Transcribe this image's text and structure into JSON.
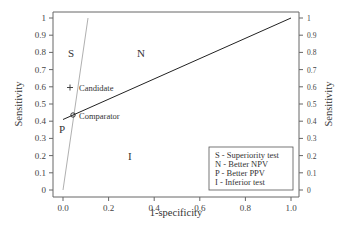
{
  "chart_data": {
    "type": "line",
    "title": "",
    "xlabel": "1-specificity",
    "ylabel": "Sensitivity",
    "ylabel_right": "Sensitivity",
    "xlim": [
      0.0,
      1.0
    ],
    "ylim": [
      0,
      1
    ],
    "x_ticks": [
      "0.0",
      "0.2",
      "0.4",
      "0.6",
      "0.8",
      "1.0"
    ],
    "y_ticks": [
      "0",
      "0.1",
      "0.2",
      "0.3",
      "0.4",
      "0.5",
      "0.6",
      "0.7",
      "0.8",
      "0.9",
      "1"
    ],
    "y_ticks_right": [
      "0",
      "0.1",
      "0.2",
      "0.3",
      "0.4",
      "0.5",
      "0.6",
      "0.7",
      "0.8",
      "0.9",
      "1"
    ],
    "grid": false,
    "series": [
      {
        "name": "Black line (through comparator to (1,1))",
        "color": "#222222",
        "x": [
          0.0,
          1.0
        ],
        "y": [
          0.41,
          1.0
        ]
      },
      {
        "name": "Grey line (through origin and comparator)",
        "color": "#aaaaaa",
        "x": [
          0.0,
          0.11
        ],
        "y": [
          0.0,
          1.0
        ]
      }
    ],
    "points": [
      {
        "label": "Candidate",
        "marker": "+",
        "x": 0.03,
        "y": 0.6
      },
      {
        "label": "Comparator",
        "marker": "o",
        "x": 0.045,
        "y": 0.44
      }
    ],
    "region_labels": [
      {
        "label": "S",
        "x": 0.04,
        "y": 0.81
      },
      {
        "label": "N",
        "x": 0.35,
        "y": 0.81
      },
      {
        "label": "P",
        "x": 0.0,
        "y": 0.38
      },
      {
        "label": "I",
        "x": 0.3,
        "y": 0.2
      }
    ],
    "legend": {
      "position": "lower right",
      "entries": [
        "S - Superiority test",
        "N - Better NPV",
        "P - Better PPV",
        "I - Inferior test"
      ]
    }
  },
  "labels": {
    "xlabel": "1-specificity",
    "ylabel": "Sensitivity",
    "ylabel_right": "Sensitivity",
    "candidate": "Candidate",
    "comparator": "Comparator",
    "region_s": "S",
    "region_n": "N",
    "region_p": "P",
    "region_i": "I",
    "legend": [
      "S - Superiority test",
      "N - Better NPV",
      "P - Better PPV",
      "I - Inferior test"
    ],
    "x_ticks": [
      "0.0",
      "0.2",
      "0.4",
      "0.6",
      "0.8",
      "1.0"
    ],
    "y_ticks": [
      "0",
      "0.1",
      "0.2",
      "0.3",
      "0.4",
      "0.5",
      "0.6",
      "0.7",
      "0.8",
      "0.9",
      "1"
    ]
  }
}
